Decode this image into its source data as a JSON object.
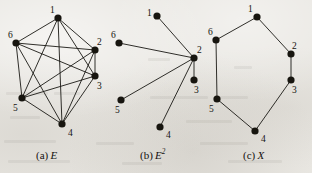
{
  "figure": {
    "width": 312,
    "height": 173,
    "background_color": "#e9e7e2",
    "ink_color": "#17150f",
    "edge_color": "#1a1814",
    "vertex_radius": 3.6,
    "edge_width": 0.9
  },
  "panels": [
    {
      "id": "panel-a",
      "caption_prefix": "(a)",
      "caption_symbol": "E",
      "caption_superscript": "",
      "caption_x": 36,
      "caption_y": 150,
      "graph_type": "complete-graph-k6",
      "vertices": [
        {
          "id": "1",
          "label": "1",
          "x": 58,
          "y": 18,
          "label_x": 50,
          "label_y": 6
        },
        {
          "id": "2",
          "label": "2",
          "x": 95,
          "y": 50,
          "label_x": 97,
          "label_y": 38
        },
        {
          "id": "3",
          "label": "3",
          "x": 95,
          "y": 76,
          "label_x": 97,
          "label_y": 82
        },
        {
          "id": "4",
          "label": "4",
          "x": 62,
          "y": 124,
          "label_x": 68,
          "label_y": 129
        },
        {
          "id": "5",
          "label": "5",
          "x": 22,
          "y": 98,
          "label_x": 13,
          "label_y": 104
        },
        {
          "id": "6",
          "label": "6",
          "x": 16,
          "y": 43,
          "label_x": 8,
          "label_y": 31
        }
      ],
      "edges": [
        [
          "1",
          "2"
        ],
        [
          "1",
          "3"
        ],
        [
          "1",
          "4"
        ],
        [
          "1",
          "5"
        ],
        [
          "1",
          "6"
        ],
        [
          "2",
          "3"
        ],
        [
          "2",
          "4"
        ],
        [
          "2",
          "5"
        ],
        [
          "2",
          "6"
        ],
        [
          "3",
          "4"
        ],
        [
          "3",
          "5"
        ],
        [
          "3",
          "6"
        ],
        [
          "4",
          "5"
        ],
        [
          "4",
          "6"
        ],
        [
          "5",
          "6"
        ]
      ]
    },
    {
      "id": "panel-b",
      "caption_prefix": "(b)",
      "caption_symbol": "E",
      "caption_superscript": "2",
      "caption_x": 140,
      "caption_y": 150,
      "graph_type": "star-graph-centered-at-2",
      "vertices": [
        {
          "id": "1",
          "label": "1",
          "x": 157,
          "y": 16,
          "label_x": 147,
          "label_y": 9
        },
        {
          "id": "2",
          "label": "2",
          "x": 194,
          "y": 58,
          "label_x": 197,
          "label_y": 46
        },
        {
          "id": "3",
          "label": "3",
          "x": 194,
          "y": 80,
          "label_x": 194,
          "label_y": 86
        },
        {
          "id": "4",
          "label": "4",
          "x": 160,
          "y": 127,
          "label_x": 166,
          "label_y": 131
        },
        {
          "id": "5",
          "label": "5",
          "x": 121,
          "y": 100,
          "label_x": 115,
          "label_y": 106
        },
        {
          "id": "6",
          "label": "6",
          "x": 119,
          "y": 43,
          "label_x": 111,
          "label_y": 31
        }
      ],
      "edges": [
        [
          "2",
          "1"
        ],
        [
          "2",
          "3"
        ],
        [
          "2",
          "4"
        ],
        [
          "2",
          "5"
        ],
        [
          "2",
          "6"
        ]
      ]
    },
    {
      "id": "panel-c",
      "caption_prefix": "(c)",
      "caption_symbol": "X",
      "caption_superscript": "",
      "caption_x": 243,
      "caption_y": 150,
      "graph_type": "hexagonal-cycle",
      "vertices": [
        {
          "id": "1",
          "label": "1",
          "x": 257,
          "y": 17,
          "label_x": 248,
          "label_y": 5
        },
        {
          "id": "2",
          "label": "2",
          "x": 291,
          "y": 54,
          "label_x": 292,
          "label_y": 42
        },
        {
          "id": "3",
          "label": "3",
          "x": 291,
          "y": 80,
          "label_x": 292,
          "label_y": 86
        },
        {
          "id": "4",
          "label": "4",
          "x": 255,
          "y": 131,
          "label_x": 261,
          "label_y": 135
        },
        {
          "id": "5",
          "label": "5",
          "x": 217,
          "y": 99,
          "label_x": 209,
          "label_y": 105
        },
        {
          "id": "6",
          "label": "6",
          "x": 216,
          "y": 40,
          "label_x": 208,
          "label_y": 28
        }
      ],
      "edges": [
        [
          "1",
          "2"
        ],
        [
          "2",
          "3"
        ],
        [
          "3",
          "4"
        ],
        [
          "4",
          "5"
        ],
        [
          "5",
          "6"
        ],
        [
          "6",
          "1"
        ]
      ]
    }
  ]
}
